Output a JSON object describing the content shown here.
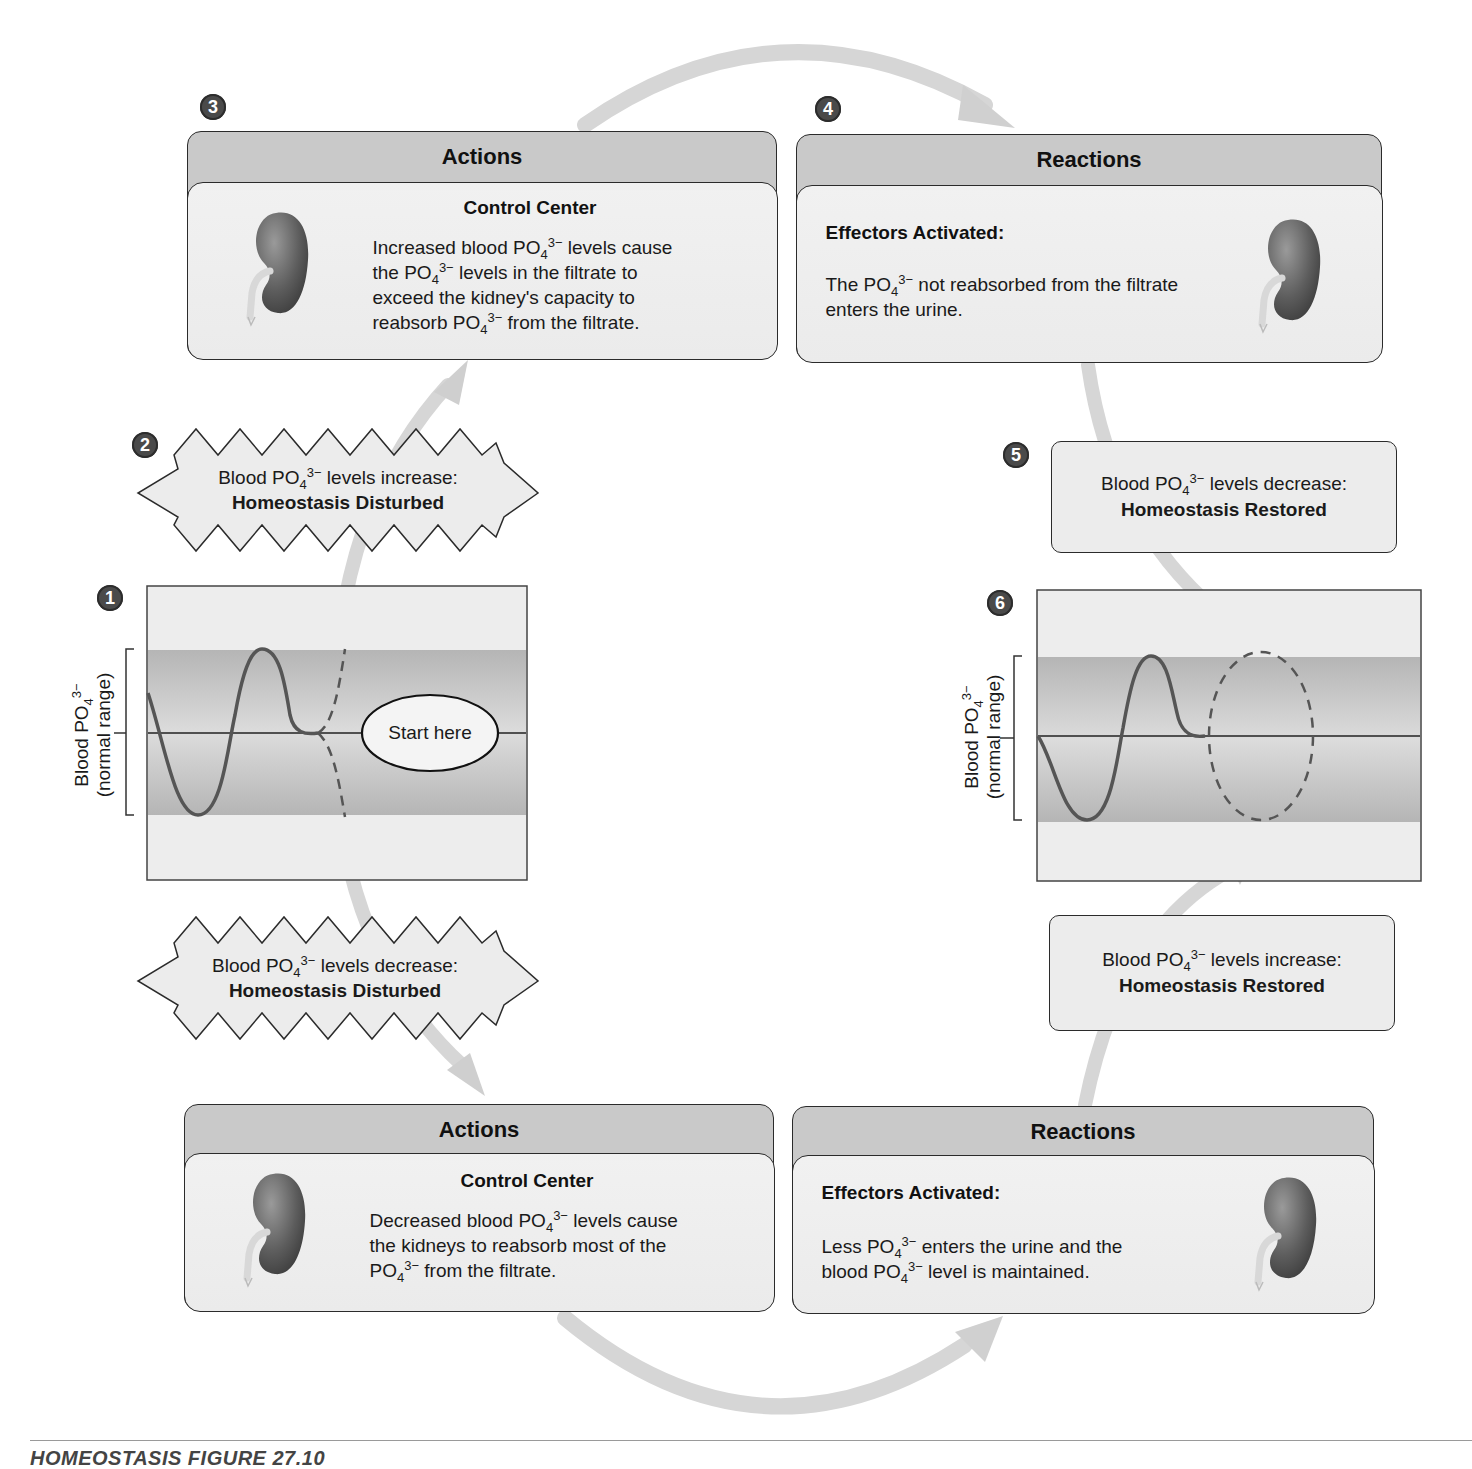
{
  "colors": {
    "panel_header": "#c9c9c9",
    "panel_body": "#eeeeee",
    "band": "#b3b3b3",
    "graph_bg": "#ededed",
    "arrow": "#d4d4d4",
    "badge": "#4a4a4a",
    "curve": "#555555",
    "outline": "#2b2b2b"
  },
  "steps": {
    "s1": "1",
    "s2": "2",
    "s3": "3",
    "s4": "4",
    "s5": "5",
    "s6": "6"
  },
  "top_actions": {
    "header": "Actions",
    "subtitle": "Control Center",
    "lines": [
      {
        "pre": "Increased blood PO",
        "sub": "4",
        "sup": "3−",
        "post": " levels cause"
      },
      {
        "pre": "the PO",
        "sub": "4",
        "sup": "3−",
        "post": " levels in the filtrate to"
      },
      {
        "pre": "exceed the kidney's capacity to",
        "sub": "",
        "sup": "",
        "post": ""
      },
      {
        "pre": "reabsorb PO",
        "sub": "4",
        "sup": "3−",
        "post": " from the filtrate."
      }
    ],
    "icon": "kidney-icon"
  },
  "top_reactions": {
    "header": "Reactions",
    "subtitle": "Effectors Activated:",
    "lines": [
      {
        "pre": "The PO",
        "sub": "4",
        "sup": "3−",
        "post": " not reabsorbed from the filtrate"
      },
      {
        "pre": "enters the urine.",
        "sub": "",
        "sup": "",
        "post": ""
      }
    ],
    "icon": "kidney-icon"
  },
  "bottom_actions": {
    "header": "Actions",
    "subtitle": "Control Center",
    "lines": [
      {
        "pre": "Decreased blood PO",
        "sub": "4",
        "sup": "3−",
        "post": " levels cause"
      },
      {
        "pre": "the kidneys to reabsorb most of the",
        "sub": "",
        "sup": "",
        "post": ""
      },
      {
        "pre": "PO",
        "sub": "4",
        "sup": "3−",
        "post": "  from the filtrate."
      }
    ],
    "icon": "kidney-icon"
  },
  "bottom_reactions": {
    "header": "Reactions",
    "subtitle": "Effectors Activated:",
    "lines": [
      {
        "pre": "Less PO",
        "sub": "4",
        "sup": "3−",
        "post": "  enters the urine and the"
      },
      {
        "pre": "blood PO",
        "sub": "4",
        "sup": "3−",
        "post": "  level is maintained."
      }
    ],
    "icon": "kidney-icon"
  },
  "burst_increase": {
    "line1": {
      "pre": "Blood PO",
      "sub": "4",
      "sup": "3−",
      "post": " levels increase:"
    },
    "line2": "Homeostasis Disturbed"
  },
  "burst_decrease": {
    "line1": {
      "pre": "Blood PO",
      "sub": "4",
      "sup": "3−",
      "post": " levels decrease:"
    },
    "line2": "Homeostasis Disturbed"
  },
  "restored_decrease": {
    "line1": {
      "pre": "Blood PO",
      "sub": "4",
      "sup": "3−",
      "post": " levels decrease:"
    },
    "line2": "Homeostasis Restored"
  },
  "restored_increase": {
    "line1": {
      "pre": "Blood PO",
      "sub": "4",
      "sup": "3−",
      "post": " levels increase:"
    },
    "line2": "Homeostasis Restored"
  },
  "graph_left": {
    "ylabel_line1": {
      "pre": "Blood PO",
      "sub": "4",
      "sup": "3−"
    },
    "ylabel_line2": "(normal range)",
    "start_label": "Start here"
  },
  "graph_right": {
    "ylabel_line1": {
      "pre": "Blood PO",
      "sub": "4",
      "sup": "3−"
    },
    "ylabel_line2": "(normal range)"
  },
  "caption": "HOMEOSTASIS FIGURE 27.10"
}
